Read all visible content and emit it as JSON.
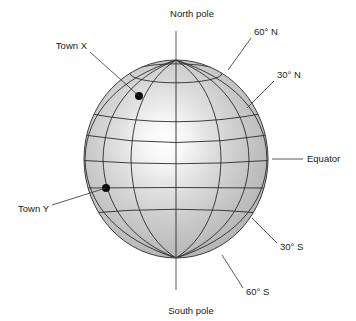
{
  "figure": {
    "background_color": "#ffffff",
    "globe": {
      "center_x": 176,
      "center_y": 159,
      "radius_x": 92,
      "radius_y": 99,
      "fill_light": "#fdfdfd",
      "fill_mid": "#c4c4c4",
      "fill_dark": "#9a9a9a",
      "outline_color": "#3d3d3d",
      "highlight_x": 165,
      "highlight_y": 152
    },
    "grid": {
      "line_color": "#2b2b2b",
      "latitudes": [
        {
          "name": "60-north",
          "degrees": 60,
          "hemisphere": "N",
          "y_offset_ratio": -0.5
        },
        {
          "name": "30-north",
          "degrees": 30,
          "hemisphere": "N",
          "y_offset_ratio": -0.25
        },
        {
          "name": "equator",
          "degrees": 0,
          "hemisphere": "",
          "y_offset_ratio": 0
        },
        {
          "name": "30-south",
          "degrees": 30,
          "hemisphere": "S",
          "y_offset_ratio": 0.25
        },
        {
          "name": "60-south",
          "degrees": 60,
          "hemisphere": "S",
          "y_offset_ratio": 0.5
        }
      ],
      "meridian_count": 7,
      "meridian_ratios": [
        -1,
        -0.72,
        -0.4,
        0,
        0.4,
        0.72,
        1
      ]
    },
    "labels": {
      "north_pole": "North pole",
      "south_pole": "South pole",
      "lat_60_north": "60° N",
      "lat_30_north": "30° N",
      "equator": "Equator",
      "lat_30_south": "30° S",
      "lat_60_south": "60° S",
      "town_x": "Town X",
      "town_y": "Town Y"
    },
    "towns": [
      {
        "label": "Town X",
        "dot_x": 139,
        "dot_y": 96,
        "dot_radius": 4
      },
      {
        "label": "Town Y",
        "dot_x": 106,
        "dot_y": 188,
        "dot_radius": 4
      }
    ]
  }
}
